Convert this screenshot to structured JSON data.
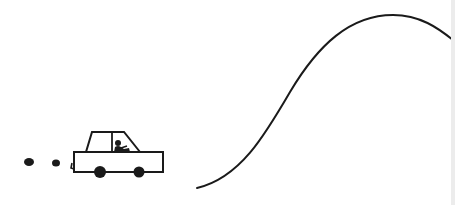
{
  "illustration": {
    "caption": "Line drawing of a car with exhaust puffs driving toward a hill-shaped curve",
    "colors": {
      "background": "#ffffff",
      "ink": "#1a1a1a",
      "edge_band": "#ececec"
    },
    "car": {
      "label": "car",
      "body": {
        "x": 74,
        "y": 152,
        "width": 89,
        "height": 20
      },
      "cabin": {
        "roof_x1": 92,
        "roof_x2": 124,
        "roof_y": 132,
        "base_x1": 86,
        "base_x2": 140,
        "base_y": 152,
        "divider_x": 112
      },
      "wheels": [
        {
          "cx": 100,
          "cy": 172,
          "r": 6
        },
        {
          "cx": 139,
          "cy": 172,
          "r": 5.5
        }
      ],
      "driver": {
        "head_cx": 118,
        "head_cy": 143,
        "head_r": 3
      }
    },
    "exhaust": [
      {
        "cx": 29,
        "cy": 162,
        "rx": 5,
        "ry": 4
      },
      {
        "cx": 56,
        "cy": 163,
        "rx": 4,
        "ry": 3.5
      }
    ],
    "curve": {
      "label": "hill-curve",
      "path": "M197,188 C240,178 265,135 290,92 C318,45 350,15 393,15 C420,15 438,28 453,40"
    }
  }
}
